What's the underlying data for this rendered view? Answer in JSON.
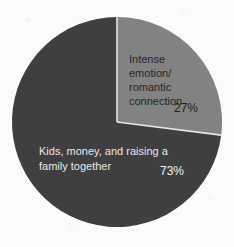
{
  "chart_data": {
    "type": "pie",
    "title": "",
    "subtitle": "",
    "xlabel": "",
    "ylabel": "",
    "legend_position": "none",
    "grid": false,
    "categories": [
      "Intense emotion/ romantic connection",
      "Kids, money, and raising a family together"
    ],
    "values": [
      27,
      73
    ],
    "value_labels": [
      "27%",
      "73%"
    ],
    "units": "percent",
    "total": 100,
    "start_angle_deg": 0,
    "direction": "clockwise",
    "slices": [
      {
        "name": "intense-emotion-romantic-connection",
        "label_lines": [
          "Intense",
          "emotion/",
          "romantic",
          "connection"
        ],
        "value": 27,
        "value_label": "27%",
        "color": "#828282",
        "label_color": "#262626",
        "value_color": "#1f1f1f",
        "start_angle_deg": 0,
        "end_angle_deg": 97.2
      },
      {
        "name": "kids-money-raising-a-family-together",
        "label_lines": [
          "Kids, money, and raising a",
          "family together"
        ],
        "value": 73,
        "value_label": "73%",
        "color": "#3f3f3f",
        "label_color": "#e8e8e8",
        "value_color": "#f2f2f2",
        "start_angle_deg": 97.2,
        "end_angle_deg": 360
      }
    ]
  },
  "colors": {
    "background": "#fbfbfb",
    "slice_light": "#828282",
    "slice_dark": "#3f3f3f",
    "separator": "#e6e6e6",
    "text_on_light": "#262626",
    "text_on_dark": "#ececec"
  },
  "geometry": {
    "center_x": 117,
    "center_y": 122,
    "radius": 105
  },
  "slice1": {
    "line1": "Intense",
    "line2": "emotion/",
    "line3": "romantic",
    "line4": "connection",
    "value": "27%"
  },
  "slice2": {
    "line1": "Kids, money, and raising a",
    "line2": "family together",
    "value": "73%"
  }
}
